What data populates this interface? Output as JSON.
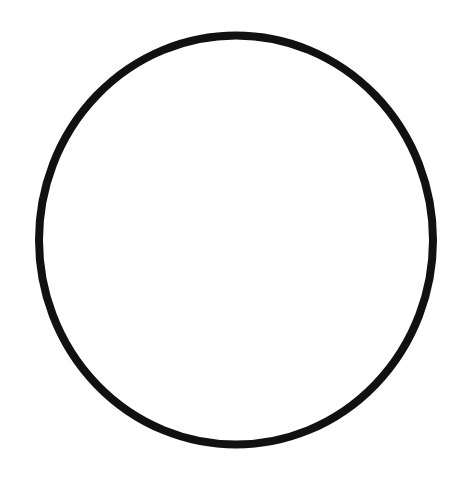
{
  "canvas": {
    "width": 470,
    "height": 485,
    "background": "#ffffff"
  },
  "shapes": [
    {
      "type": "ellipse-outline",
      "cx": 236,
      "cy": 240,
      "rx": 197,
      "ry": 204.5,
      "stroke": "#111111",
      "stroke_width": 8,
      "fill": "none"
    }
  ]
}
